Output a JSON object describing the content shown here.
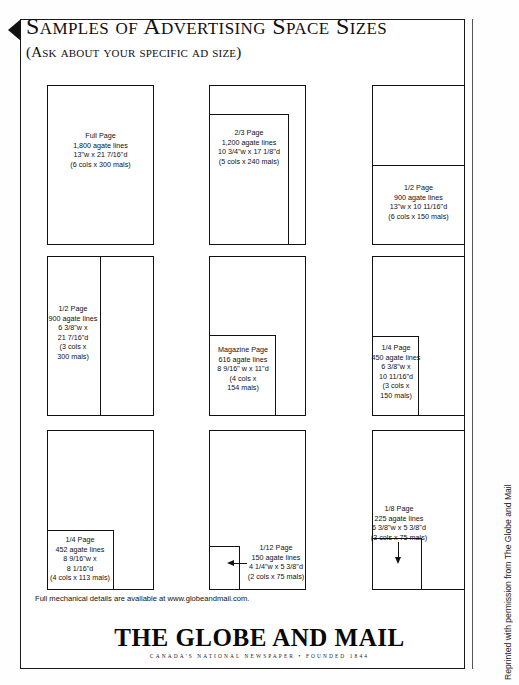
{
  "document": {
    "title": "Samples of Advertising Space Sizes",
    "subtitle": "(Ask about your specific ad size)",
    "footer_note": "Full mechanical details are available at www.globeandmail.com.",
    "masthead_title": "THE GLOBE AND MAIL",
    "masthead_tagline": "CANADA'S NATIONAL NEWSPAPER • FOUNDED 1844",
    "side_credit": "Reprinted with permission from The Globe and Mail"
  },
  "samples": [
    {
      "id": "full-page",
      "name": "Full Page",
      "lines": [
        "Full Page",
        "1,800 agate lines",
        "13\"w x 21  7/16\"d",
        "(6 cols x 300 mals)"
      ],
      "agate_lines": 1800,
      "width_in": "13\"",
      "depth_in": "21 7/16\"",
      "cols": 6,
      "mals": 300
    },
    {
      "id": "two-thirds-page",
      "name": "2/3 Page",
      "lines": [
        "2/3 Page",
        "1,200 agate lines",
        "10  3/4\"w x 17  1/8\"d",
        "(5 cols x 240 mals)"
      ],
      "agate_lines": 1200,
      "width_in": "10 3/4\"",
      "depth_in": "17 1/8\"",
      "cols": 5,
      "mals": 240
    },
    {
      "id": "half-page-horizontal",
      "name": "1/2 Page",
      "lines": [
        "1/2 Page",
        "900 agate lines",
        "13\"w x 10  11/16\"d",
        "(6 cols x 150 mals)"
      ],
      "agate_lines": 900,
      "width_in": "13\"",
      "depth_in": "10 11/16\"",
      "cols": 6,
      "mals": 150
    },
    {
      "id": "half-page-vertical",
      "name": "1/2 Page",
      "lines": [
        "1/2 Page",
        "900 agate lines",
        "6  3/8\"w x",
        "21 7/16\"d",
        "(3 cols x",
        "300 mals)"
      ],
      "agate_lines": 900,
      "width_in": "6 3/8\"",
      "depth_in": "21 7/16\"",
      "cols": 3,
      "mals": 300
    },
    {
      "id": "magazine-page",
      "name": "Magazine Page",
      "lines": [
        "Magazine Page",
        "616 agate lines",
        "8 9/16\"  w x 11\"d",
        "(4 cols x",
        "154 mals)"
      ],
      "agate_lines": 616,
      "width_in": "8 9/16\"",
      "depth_in": "11\"",
      "cols": 4,
      "mals": 154
    },
    {
      "id": "quarter-page-vertical",
      "name": "1/4 Page",
      "lines": [
        "1/4 Page",
        "450 agate lines",
        "6  3/8\"w x",
        "10  11/16\"d",
        "(3 cols x",
        "150 mals)"
      ],
      "agate_lines": 450,
      "width_in": "6 3/8\"",
      "depth_in": "10 11/16\"",
      "cols": 3,
      "mals": 150
    },
    {
      "id": "quarter-page-horizontal",
      "name": "1/4 Page",
      "lines": [
        "1/4 Page",
        "452 agate lines",
        "8 9/16\"w x",
        "8  1/16\"d",
        "(4 cols x 113 mals)"
      ],
      "agate_lines": 452,
      "width_in": "8 9/16\"",
      "depth_in": "8 1/16\"",
      "cols": 4,
      "mals": 113
    },
    {
      "id": "twelfth-page",
      "name": "1/12 Page",
      "lines": [
        "1/12 Page",
        "150 agate lines",
        "4 1/4\"w x 5  3/8\"d",
        "(2 cols x 75 mals)"
      ],
      "agate_lines": 150,
      "width_in": "4 1/4\"",
      "depth_in": "5 3/8\"",
      "cols": 2,
      "mals": 75
    },
    {
      "id": "eighth-page",
      "name": "1/8 Page",
      "lines": [
        "1/8 Page",
        "225 agate lines",
        "6 3/8\"w x 5 3/8\"d",
        "(3 cols x 75 mals)"
      ],
      "agate_lines": 225,
      "width_in": "6 3/8\"",
      "depth_in": "5 3/8\"",
      "cols": 3,
      "mals": 75
    }
  ],
  "icons": {
    "corner_marker": "left-triangle-marker",
    "arrow_left": "arrow-left-icon",
    "arrow_down": "arrow-down-icon"
  },
  "colors": {
    "ink": "#111111",
    "paper": "#ffffff"
  }
}
